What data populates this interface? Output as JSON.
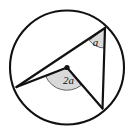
{
  "figure": {
    "kind": "circle-geometry-diagram",
    "background_color": "#ffffff",
    "stroke_color": "#111111",
    "arc_fill_color": "#d9d9d9",
    "arc_stroke_color": "#555555",
    "circle": {
      "center_x": 67,
      "center_y": 67.5,
      "radius": 57,
      "stroke_width": 2.1
    },
    "center_dot": {
      "x": 67,
      "y": 67.5,
      "radius": 2.6
    },
    "points": {
      "center": {
        "x": 67,
        "y": 67.5
      },
      "left": {
        "x": 16.5,
        "y": 87.0
      },
      "top_right": {
        "x": 105.0,
        "y": 28.0
      },
      "bottom_right": {
        "x": 102.5,
        "y": 108.5
      }
    },
    "segments": [
      {
        "name": "left-to-top-right",
        "x1": 16.5,
        "y1": 87.0,
        "x2": 105.0,
        "y2": 28.0
      },
      {
        "name": "left-to-center",
        "x1": 16.5,
        "y1": 87.0,
        "x2": 67,
        "y2": 67.5
      },
      {
        "name": "center-to-bottom-right",
        "x1": 67,
        "y1": 67.5,
        "x2": 102.5,
        "y2": 108.5
      },
      {
        "name": "top-right-to-bottom-right",
        "x1": 105.0,
        "y1": 28.0,
        "x2": 102.5,
        "y2": 108.5
      }
    ],
    "labels": {
      "inscribed_angle": "a",
      "central_angle": "2a"
    },
    "label_positions": {
      "inscribed_angle": {
        "x": 95.5,
        "y": 45.5,
        "font_size": 11
      },
      "central_angle": {
        "x": 68.5,
        "y": 84.0,
        "font_size": 11
      }
    },
    "angle_arcs": {
      "inscribed": {
        "vertex_x": 105.0,
        "vertex_y": 28.0,
        "radius": 20,
        "path": "M 105 28 L 89.3 40.4 A 20 20 0 0 0 104.4 48.0 Z"
      },
      "central": {
        "vertex_x": 67,
        "vertex_y": 67.5,
        "radius": 23,
        "path": "M 67 67.5 L 45.8 76.4 A 23 23 0 0 0 81.0 85.4 Z"
      }
    }
  }
}
